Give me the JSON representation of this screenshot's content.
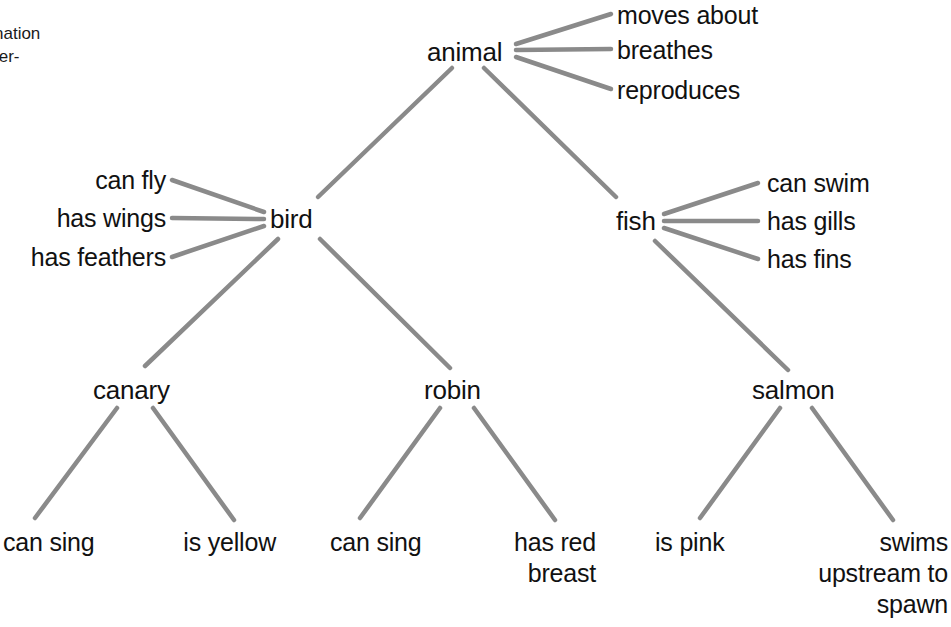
{
  "figure": {
    "type": "semantic-network-hierarchy",
    "margin_note_line1": "nation",
    "margin_note_line2": "ter-",
    "link_color": "#8a8a8a",
    "text_color": "#111111",
    "background": "#ffffff"
  },
  "nodes": {
    "animal": "animal",
    "bird": "bird",
    "fish": "fish",
    "canary": "canary",
    "robin": "robin",
    "salmon": "salmon"
  },
  "properties": {
    "animal": [
      "moves about",
      "breathes",
      "reproduces"
    ],
    "bird": [
      "can fly",
      "has wings",
      "has feathers"
    ],
    "fish": [
      "can swim",
      "has gills",
      "has fins"
    ],
    "canary": [
      "can\nsing",
      "is\nyellow"
    ],
    "robin": [
      "can\nsing",
      "has red\nbreast"
    ],
    "salmon": [
      "is pink",
      "swims\nupstream\nto spawn"
    ]
  },
  "labels": {
    "animal_prop_1": "moves about",
    "animal_prop_2": "breathes",
    "animal_prop_3": "reproduces",
    "bird_prop_1": "can fly",
    "bird_prop_2": "has wings",
    "bird_prop_3": "has feathers",
    "fish_prop_1": "can swim",
    "fish_prop_2": "has gills",
    "fish_prop_3": "has fins",
    "canary_prop_1": "can sing",
    "canary_prop_2": "is yellow",
    "robin_prop_1": "can sing",
    "robin_prop_2": "has red breast",
    "salmon_prop_1": "is pink",
    "salmon_prop_2": "swims upstream to spawn"
  },
  "edges": [
    {
      "from": "animal",
      "to": "moves about"
    },
    {
      "from": "animal",
      "to": "breathes"
    },
    {
      "from": "animal",
      "to": "reproduces"
    },
    {
      "from": "animal",
      "to": "bird"
    },
    {
      "from": "animal",
      "to": "fish"
    },
    {
      "from": "bird",
      "to": "can fly"
    },
    {
      "from": "bird",
      "to": "has wings"
    },
    {
      "from": "bird",
      "to": "has feathers"
    },
    {
      "from": "bird",
      "to": "canary"
    },
    {
      "from": "bird",
      "to": "robin"
    },
    {
      "from": "fish",
      "to": "can swim"
    },
    {
      "from": "fish",
      "to": "has gills"
    },
    {
      "from": "fish",
      "to": "has fins"
    },
    {
      "from": "fish",
      "to": "salmon"
    },
    {
      "from": "canary",
      "to": "can sing"
    },
    {
      "from": "canary",
      "to": "is yellow"
    },
    {
      "from": "robin",
      "to": "can sing"
    },
    {
      "from": "robin",
      "to": "has red breast"
    },
    {
      "from": "salmon",
      "to": "is pink"
    },
    {
      "from": "salmon",
      "to": "swims upstream to spawn"
    }
  ]
}
